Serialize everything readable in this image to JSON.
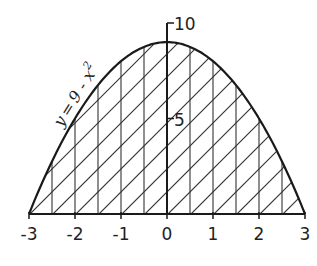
{
  "chart_data": {
    "type": "area",
    "title": "",
    "function_label": "y = 9 - x²",
    "function_label_parts": {
      "lhs": "y",
      "eq": "=",
      "rhs": "9 - x",
      "exp": "2"
    },
    "xlabel": "",
    "ylabel": "",
    "xlim": [
      -3,
      3
    ],
    "ylim": [
      0,
      10
    ],
    "x_ticks": [
      -3,
      -2,
      -1,
      0,
      1,
      2,
      3
    ],
    "x_tick_labels": [
      "-3",
      "-2",
      "-1",
      "0",
      "1",
      "2",
      "3"
    ],
    "y_ticks": [
      5,
      10
    ],
    "y_tick_labels": [
      "5",
      "10"
    ],
    "grid": false,
    "legend": null,
    "shading": "hatched region under curve between x=-3 and x=3 (vertical lines every 0.5 plus diagonal hatching)",
    "series": [
      {
        "name": "y = 9 - x^2",
        "x": [
          -3,
          -2.5,
          -2,
          -1.5,
          -1,
          -0.5,
          0,
          0.5,
          1,
          1.5,
          2,
          2.5,
          3
        ],
        "y": [
          0,
          2.75,
          5,
          6.75,
          8,
          8.75,
          9,
          8.75,
          8,
          6.75,
          5,
          2.75,
          0
        ]
      }
    ]
  },
  "colors": {
    "ink": "#222222",
    "background": "#ffffff"
  }
}
